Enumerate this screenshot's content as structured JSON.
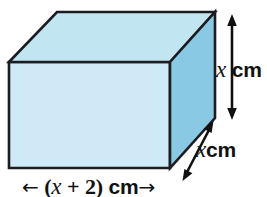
{
  "figure": {
    "kind": "cuboid-diagram",
    "colors": {
      "front_face": "#cfeaf6",
      "top_face": "#c2e5f2",
      "right_face": "#8ac9e3",
      "outline": "#1c1c22",
      "label_text": "#111111",
      "background": "#ffffff"
    },
    "labels": {
      "height": {
        "variable": "x",
        "unit": "cm"
      },
      "depth": {
        "variable": "x",
        "unit": "cm"
      },
      "width": {
        "open_paren": "(",
        "variable": "x",
        "operator": "+",
        "term": "2",
        "close_paren": ")",
        "unit": "cm",
        "left_arrow": "←",
        "right_arrow": "→"
      }
    },
    "dimensions": {
      "height_expression": "x cm",
      "depth_expression": "x cm",
      "width_expression": "(x + 2) cm"
    }
  }
}
